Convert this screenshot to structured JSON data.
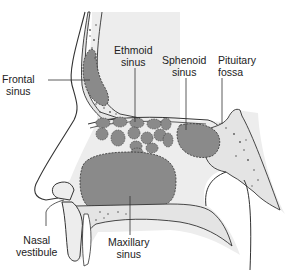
{
  "diagram": {
    "type": "anatomical-cross-section",
    "colors": {
      "background": "#ffffff",
      "tissue": "#ededed",
      "bone": "#e4e4e4",
      "sinus_fill": "#8a8a8a",
      "outline": "#333333",
      "label_text": "#222222"
    },
    "labels": {
      "frontal": {
        "line1": "Frontal",
        "line2": "sinus"
      },
      "ethmoid": {
        "line1": "Ethmoid",
        "line2": "sinus"
      },
      "sphenoid": {
        "line1": "Sphenoid",
        "line2": "sinus"
      },
      "pituitary": {
        "line1": "Pituitary",
        "line2": "fossa"
      },
      "nasal_vestibule": {
        "line1": "Nasal",
        "line2": "vestibule"
      },
      "maxillary": {
        "line1": "Maxillary",
        "line2": "sinus"
      }
    }
  }
}
